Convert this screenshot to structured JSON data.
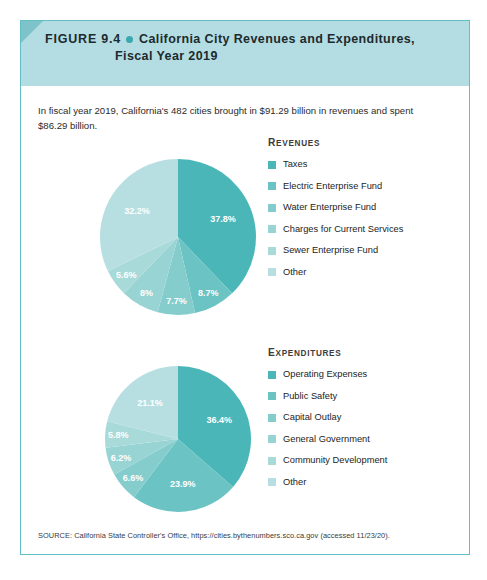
{
  "figure": {
    "number": "FIGURE 9.4",
    "title_line1": "California City Revenues and Expenditures,",
    "title_line2": "Fiscal Year 2019",
    "intro": "In fiscal year 2019, California's 482 cities brought in $91.29 billion in revenues and spent $86.29 billion.",
    "source": "SOURCE: California State Controller's Office, https://cities.bythenumbers.sco.ca.gov (accessed 11/23/20)."
  },
  "palette": {
    "accent_dot": "#3aa8ae",
    "header_band": "#b3dde2",
    "header_notch": "#7ec3c9",
    "border": "#63bfc6",
    "ramp": [
      "#4bb6b8",
      "#6cc3c4",
      "#85cdcd",
      "#99d4d4",
      "#a9dada",
      "#b7dfe2"
    ]
  },
  "chart_data": [
    {
      "type": "pie",
      "name": "revenues",
      "title": "Revenues",
      "legend_position": "right",
      "center": [
        105,
        100
      ],
      "radius": 78,
      "categories": [
        "Taxes",
        "Electric Enterprise Fund",
        "Water Enterprise Fund",
        "Charges for Current Services",
        "Sewer Enterprise Fund",
        "Other"
      ],
      "values": [
        37.8,
        8.7,
        7.7,
        8,
        5.6,
        32.2
      ],
      "labels": [
        "37.8%",
        "8.7%",
        "7.7%",
        "8%",
        "5.6%",
        "32.2%"
      ],
      "colors": [
        "#4bb6b8",
        "#6cc3c4",
        "#85cdcd",
        "#99d4d4",
        "#a9dada",
        "#b7dfe2"
      ],
      "unit": "percent"
    },
    {
      "type": "pie",
      "name": "expenditures",
      "title": "Expenditures",
      "legend_position": "right",
      "center": [
        105,
        92
      ],
      "radius": 73,
      "categories": [
        "Operating Expenses",
        "Public Safety",
        "Capital Outlay",
        "General Government",
        "Community Development",
        "Other"
      ],
      "values": [
        36.4,
        23.9,
        6.6,
        6.2,
        5.8,
        21.1
      ],
      "labels": [
        "36.4%",
        "23.9%",
        "6.6%",
        "6.2%",
        "5.8%",
        "21.1%"
      ],
      "colors": [
        "#4bb6b8",
        "#6cc3c4",
        "#85cdcd",
        "#99d4d4",
        "#a9dada",
        "#b7dfe2"
      ],
      "unit": "percent"
    }
  ]
}
